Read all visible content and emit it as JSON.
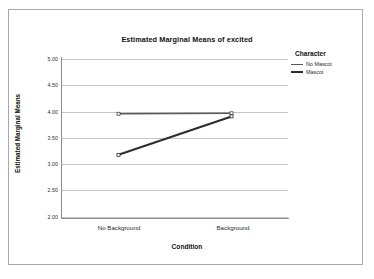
{
  "chart_data": {
    "type": "line",
    "title": "Estimated Marginal Means of excited",
    "xlabel": "Condition",
    "ylabel": "Estimated Marginal Means",
    "categories": [
      "No Background",
      "Background"
    ],
    "ylim": [
      2.0,
      5.0
    ],
    "yticks": [
      "5.00",
      "4.50",
      "4.00",
      "3.50",
      "3.00",
      "2.50",
      "2.00"
    ],
    "ytick_values": [
      5.0,
      4.5,
      4.0,
      3.5,
      3.0,
      2.5,
      2.0
    ],
    "grid": true,
    "legend_position": "right",
    "legend_title": "Character",
    "series": [
      {
        "name": "No Mascot",
        "values": [
          3.96,
          3.97
        ],
        "color": "#5a5a5a"
      },
      {
        "name": "Mascot",
        "values": [
          3.18,
          3.91
        ],
        "color": "#2e2e2e"
      }
    ]
  }
}
